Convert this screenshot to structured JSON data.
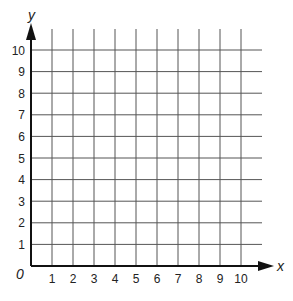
{
  "chart_data": {
    "type": "grid",
    "title": "",
    "xlabel": "x",
    "ylabel": "y",
    "origin_label": "0",
    "xlim": [
      0,
      10
    ],
    "ylim": [
      0,
      10
    ],
    "x_ticks": [
      "1",
      "2",
      "3",
      "4",
      "5",
      "6",
      "7",
      "8",
      "9",
      "10"
    ],
    "y_ticks": [
      "1",
      "2",
      "3",
      "4",
      "5",
      "6",
      "7",
      "8",
      "9",
      "10"
    ],
    "grid": true,
    "series": []
  },
  "colors": {
    "grid": "#555555",
    "axis": "#111111",
    "background": "#ffffff"
  }
}
